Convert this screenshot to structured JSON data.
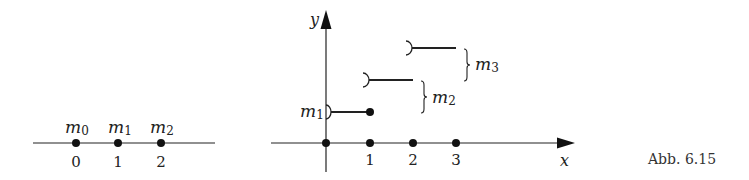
{
  "figure": {
    "caption": "Abb. 6.15",
    "colors": {
      "ink": "#222222",
      "background": "#ffffff"
    }
  },
  "left_number_line": {
    "points": [
      {
        "mass": "m",
        "mass_sub": "0",
        "tick": "0"
      },
      {
        "mass": "m",
        "mass_sub": "1",
        "tick": "1"
      },
      {
        "mass": "m",
        "mass_sub": "2",
        "tick": "2"
      }
    ]
  },
  "step_plot": {
    "x_axis_label": "x",
    "y_axis_label": "y",
    "x_ticks": [
      "1",
      "2",
      "3"
    ],
    "steps": [
      {
        "label": "m",
        "label_sub": "1",
        "from": "0",
        "to": "1",
        "left_end": "open",
        "right_end": "closed"
      },
      {
        "label": "m",
        "label_sub": "2",
        "from": "1",
        "to": "2",
        "left_end": "open",
        "right_end": "none"
      },
      {
        "label": "m",
        "label_sub": "3",
        "from": "2",
        "to": "3",
        "left_end": "open",
        "right_end": "none"
      }
    ]
  }
}
